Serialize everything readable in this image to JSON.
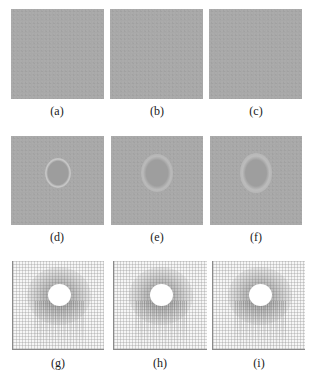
{
  "figure": {
    "rows": [
      {
        "row_type": "uniform-gray",
        "panels": [
          {
            "label": "(a)"
          },
          {
            "label": "(b)"
          },
          {
            "label": "(c)"
          }
        ]
      },
      {
        "row_type": "gray-with-circular-halo",
        "panels": [
          {
            "label": "(d)"
          },
          {
            "label": "(e)"
          },
          {
            "label": "(f)"
          }
        ]
      },
      {
        "row_type": "mesh-with-hole",
        "panels": [
          {
            "label": "(g)"
          },
          {
            "label": "(h)"
          },
          {
            "label": "(i)"
          }
        ]
      }
    ],
    "colors": {
      "panel_gray": "#a8a8a8",
      "halo_light": "#c4c4c4",
      "inner_dark": "#9c9c9c",
      "mesh_bg": "#f6f6f6",
      "hole": "#ffffff"
    }
  }
}
